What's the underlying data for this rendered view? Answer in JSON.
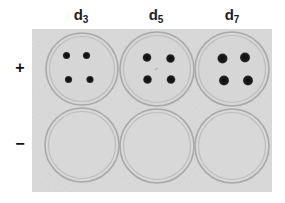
{
  "figure": {
    "columns": [
      {
        "base": "d",
        "sub": "3"
      },
      {
        "base": "d",
        "sub": "5"
      },
      {
        "base": "d",
        "sub": "7"
      }
    ],
    "rows": [
      {
        "label": "+"
      },
      {
        "label": "−"
      }
    ],
    "plates": [
      {
        "row": 0,
        "col": 0,
        "spots": 4,
        "spot_radius": 3.6
      },
      {
        "row": 0,
        "col": 1,
        "spots": 4,
        "spot_radius": 4.3
      },
      {
        "row": 0,
        "col": 2,
        "spots": 4,
        "spot_radius": 5.0
      },
      {
        "row": 1,
        "col": 0,
        "spots": 0
      },
      {
        "row": 1,
        "col": 1,
        "spots": 0
      },
      {
        "row": 1,
        "col": 2,
        "spots": 0
      }
    ],
    "colors": {
      "background": "#dcdcdc",
      "plate_rim": "#a8a8a8",
      "spot": "#151515"
    }
  }
}
